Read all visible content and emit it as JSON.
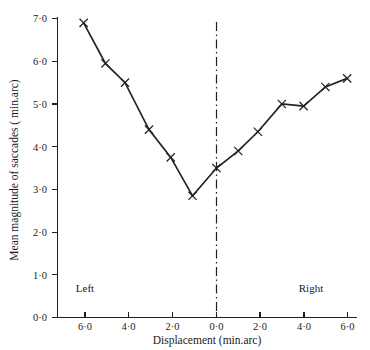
{
  "chart_data": {
    "type": "line",
    "title": "",
    "xlabel": "Displacement  (min.arc)",
    "ylabel": "Mean magnitude of saccades ( min.arc)",
    "xlim": [
      -7.05,
      6.7
    ],
    "ylim": [
      0.0,
      7.35
    ],
    "grid": false,
    "legend": null,
    "x": [
      -6.1,
      -5.1,
      -4.2,
      -3.1,
      -2.1,
      -1.1,
      0.0,
      1.0,
      1.9,
      3.0,
      4.0,
      5.0,
      6.0
    ],
    "values": [
      6.9,
      5.95,
      5.5,
      4.4,
      3.75,
      2.85,
      3.5,
      3.9,
      4.35,
      5.0,
      4.95,
      5.4,
      5.6
    ],
    "series": [
      {
        "name": "Mean magnitude of saccades",
        "marker": "x",
        "x": [
          -6.1,
          -5.1,
          -4.2,
          -3.1,
          -2.1,
          -1.1,
          0.0,
          1.0,
          1.9,
          3.0,
          4.0,
          5.0,
          6.0
        ],
        "values": [
          6.9,
          5.95,
          5.5,
          4.4,
          3.75,
          2.85,
          3.5,
          3.9,
          4.35,
          5.0,
          4.95,
          5.4,
          5.6
        ]
      }
    ],
    "xticks": [
      -6,
      -4,
      -2,
      0,
      2,
      4,
      6
    ],
    "xtick_labels": [
      "6·0",
      "4·0",
      "2·0",
      "0·0",
      "2·0",
      "4·0",
      "6·0"
    ],
    "yticks": [
      0,
      1,
      2,
      3,
      4,
      5,
      6,
      7
    ],
    "ytick_labels": [
      "0·0",
      "1·0",
      "2·0",
      "3·0",
      "4·0",
      "5·0",
      "6·0",
      "7·0"
    ],
    "annotations": [
      {
        "name": "left-region-label",
        "text": "Left",
        "x": -5.25,
        "y": 0.72
      },
      {
        "name": "right-region-label",
        "text": "Right",
        "x": 4.25,
        "y": 0.72
      }
    ],
    "reference_line": {
      "name": "zero-displacement-line",
      "orientation": "vertical",
      "x": 0.0,
      "style": "dash-dot"
    },
    "colors": {
      "line": "#232323",
      "axis": "#1f1f1f",
      "text": "#1a1a1a",
      "background": "#ffffff"
    }
  },
  "labels": {
    "xaxis_title": "Displacement  (min.arc)",
    "yaxis_title": "Mean magnitude of saccades ( min.arc)",
    "left": "Left",
    "right": "Right",
    "x_0": "6·0",
    "x_1": "4·0",
    "x_2": "2·0",
    "x_3": "0·0",
    "x_4": "2·0",
    "x_5": "4·0",
    "x_6": "6·0",
    "y_0": "0·0",
    "y_1": "1·0",
    "y_2": "2·0",
    "y_3": "3·0",
    "y_4": "4·0",
    "y_5": "5·0",
    "y_6": "6·0",
    "y_7": "7·0"
  }
}
